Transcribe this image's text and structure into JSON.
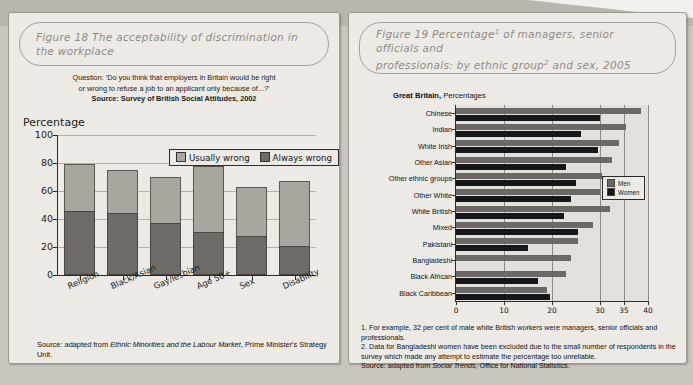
{
  "figure18": {
    "title": "Figure 18  The acceptability of discrimination in the workplace",
    "question_line1": "Question: 'Do you think that employers in Britain would be right",
    "question_line2": "or wrong to refuse a job to an applicant only because of...?'",
    "question_source": "Source: Survey of British Social Attitudes, 2002",
    "axis_title": "Percentage",
    "legend": {
      "usually": "Usually wrong",
      "always": "Always wrong"
    },
    "source_note": "Source: adapted from Ethnic Minorities and the Labour Market, Prime Minister's Strategy Unit.",
    "source_prefix": "Source: adapted from ",
    "source_italic": "Ethnic Minorities and the Labour Market",
    "source_suffix": ", Prime Minister's Strategy Unit.",
    "colors": {
      "usually": "#a9a6a0",
      "always": "#6e6b66"
    }
  },
  "figure19": {
    "title_line1": "Figure 19 Percentage1 of managers, senior officials and",
    "title_line2": "professionals: by ethnic group2 and sex, 2005",
    "region_bold": "Great Britain,",
    "region_rest": " Percentages",
    "legend": {
      "men": "Men",
      "women": "Women"
    },
    "note1": "1.  For example, 32 per cent of male white British workers were managers, senior officials and professionals.",
    "note2": "2.  Data for Bangladeshi women have been excluded due to the small number of respondents in the survey which made any attempt to estimate the percentage too unreliable.",
    "note3_prefix": "Source: adapted from ",
    "note3_italic": "Social Trends",
    "note3_suffix": ", Office for National Statistics.",
    "colors": {
      "men": "#6b6865",
      "women": "#17161a"
    }
  },
  "chart_data": [
    {
      "type": "bar",
      "id": "figure-18",
      "title": "The acceptability of discrimination in the workplace",
      "subtitle": "Question: 'Do you think that employers in Britain would be right or wrong to refuse a job to an applicant only because of...?'",
      "source": "Survey of British Social Attitudes, 2002",
      "stacked": true,
      "orientation": "vertical",
      "xlabel": "",
      "ylabel": "Percentage",
      "ylim": [
        0,
        100
      ],
      "yticks": [
        0,
        20,
        40,
        60,
        80,
        100
      ],
      "grid": true,
      "legend_position": "top-right",
      "categories": [
        "Religion",
        "Black/Asian",
        "Gay/lesbian",
        "Age 50+",
        "Sex",
        "Disability"
      ],
      "series": [
        {
          "name": "Always wrong",
          "values": [
            46,
            44,
            37,
            31,
            28,
            21
          ]
        },
        {
          "name": "Usually wrong",
          "values": [
            33,
            31,
            33,
            47,
            35,
            46
          ]
        }
      ],
      "totals": [
        79,
        75,
        70,
        78,
        63,
        67
      ]
    },
    {
      "type": "bar",
      "id": "figure-19",
      "title": "Percentage of managers, senior officials and professionals: by ethnic group and sex, 2005",
      "region": "Great Britain",
      "units": "Percentages",
      "orientation": "horizontal",
      "xlabel": "",
      "ylabel": "",
      "xlim": [
        0,
        40
      ],
      "xticks": [
        0,
        10,
        20,
        30,
        35,
        40
      ],
      "grid": true,
      "legend_position": "bottom-right",
      "categories": [
        "Chinese",
        "Indian",
        "White Irish",
        "Other Asian",
        "Other ethnic groups",
        "Other White",
        "White British",
        "Mixed",
        "Pakistani",
        "Bangladeshi",
        "Black African",
        "Black Caribbean"
      ],
      "series": [
        {
          "name": "Men",
          "values": [
            38.5,
            35.5,
            34.0,
            32.5,
            30.5,
            30.0,
            32.0,
            28.5,
            25.5,
            24.0,
            23.0,
            19.0
          ]
        },
        {
          "name": "Women",
          "values": [
            30.0,
            26.0,
            29.5,
            23.0,
            25.0,
            24.0,
            22.5,
            25.5,
            15.0,
            null,
            17.0,
            19.5
          ]
        }
      ]
    }
  ]
}
